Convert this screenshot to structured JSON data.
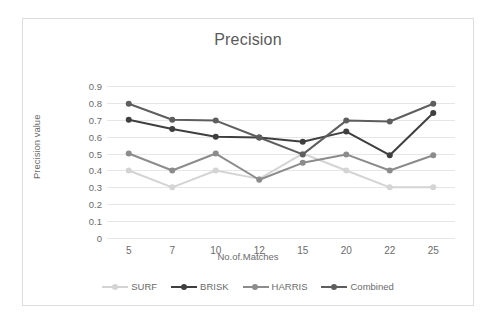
{
  "chart_data": {
    "type": "line",
    "title": "Precision",
    "xlabel": "No.of.Matches",
    "ylabel": "Precision value",
    "categories": [
      "5",
      "7",
      "10",
      "12",
      "15",
      "20",
      "22",
      "25"
    ],
    "ytick_labels": [
      "0.9",
      "0.8",
      "0.7",
      "0.6",
      "0.5",
      "0.4",
      "0.3",
      "0.2",
      "0.1",
      "0"
    ],
    "ytick_values": [
      0.9,
      0.8,
      0.7,
      0.6,
      0.5,
      0.4,
      0.3,
      0.2,
      0.1,
      0
    ],
    "ylim": [
      0,
      0.9
    ],
    "grid": true,
    "legend_position": "bottom",
    "series": [
      {
        "name": "SURF",
        "color": "#d4d4d4",
        "values": [
          0.4,
          0.3,
          0.4,
          0.35,
          0.5,
          0.4,
          0.3,
          0.3
        ]
      },
      {
        "name": "BRISK",
        "color": "#3f3f3f",
        "values": [
          0.7,
          0.645,
          0.6,
          0.595,
          0.57,
          0.63,
          0.49,
          0.74
        ]
      },
      {
        "name": "HARRIS",
        "color": "#8c8c8c",
        "values": [
          0.5,
          0.4,
          0.5,
          0.345,
          0.445,
          0.495,
          0.4,
          0.49
        ]
      },
      {
        "name": "Combined",
        "color": "#5e5e5e",
        "values": [
          0.795,
          0.7,
          0.695,
          0.595,
          0.495,
          0.695,
          0.69,
          0.795
        ]
      }
    ]
  },
  "legend": {
    "items": [
      {
        "label": "SURF"
      },
      {
        "label": "BRISK"
      },
      {
        "label": "HARRIS"
      },
      {
        "label": "Combined"
      }
    ]
  }
}
